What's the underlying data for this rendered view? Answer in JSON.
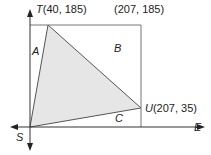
{
  "diagram": {
    "type": "coordinate-geometry",
    "axes": {
      "horizontal_label": "E",
      "vertical_label": "S",
      "origin_label": "S"
    },
    "points": {
      "T": {
        "name": "T",
        "coords": "(40, 185)",
        "label": "T(40, 185)"
      },
      "corner": {
        "coords": "(207, 185)",
        "label": "(207, 185)"
      },
      "U": {
        "name": "U",
        "coords": "(207, 35)",
        "label": "U(207, 35)"
      },
      "S": {
        "name": "S",
        "label": "S"
      }
    },
    "regions": {
      "A": "A",
      "B": "B",
      "C": "C"
    },
    "colors": {
      "line": "#555555",
      "fill": "#e6e6e6",
      "text": "#222222"
    }
  }
}
